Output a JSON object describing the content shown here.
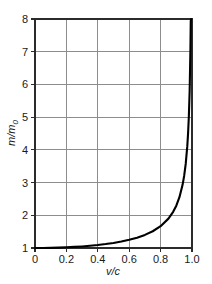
{
  "chart_data": {
    "type": "line",
    "title": "",
    "subtitle": "",
    "xlabel": "v/c",
    "ylabel": "m/m0",
    "ylabel_parts": {
      "main": "m/m",
      "sub": "0"
    },
    "xlim": [
      0,
      1.0
    ],
    "ylim": [
      1,
      8
    ],
    "xticks": [
      0,
      0.2,
      0.4,
      0.6,
      0.8,
      1.0
    ],
    "xtick_labels": [
      "0",
      "0.2",
      "0.4",
      "0.6",
      "0.8",
      "1.0"
    ],
    "yticks": [
      1,
      2,
      3,
      4,
      5,
      6,
      7,
      8
    ],
    "ytick_labels": [
      "1",
      "2",
      "3",
      "4",
      "5",
      "6",
      "7",
      "8"
    ],
    "grid": true,
    "grid_color": "#8d8d8d",
    "frame_color": "#2b2b2b",
    "legend": null,
    "legend_position": "none",
    "annotations": [],
    "series": [
      {
        "name": "relativistic mass ratio",
        "formula": "m/m0 = 1/sqrt(1-(v/c)^2)",
        "color": "#000000",
        "x": [
          0,
          0.05,
          0.1,
          0.15,
          0.2,
          0.25,
          0.3,
          0.35,
          0.4,
          0.45,
          0.5,
          0.55,
          0.6,
          0.65,
          0.7,
          0.75,
          0.8,
          0.85,
          0.88,
          0.9,
          0.92,
          0.94,
          0.95,
          0.96,
          0.97,
          0.975,
          0.98,
          0.985,
          0.99,
          0.992
        ],
        "values": [
          1.0,
          1.001,
          1.005,
          1.011,
          1.021,
          1.033,
          1.048,
          1.068,
          1.091,
          1.12,
          1.155,
          1.197,
          1.25,
          1.316,
          1.4,
          1.512,
          1.667,
          1.898,
          2.105,
          2.294,
          2.552,
          2.931,
          3.203,
          3.571,
          4.113,
          4.5,
          5.025,
          5.799,
          7.089,
          7.93
        ]
      }
    ]
  },
  "axis": {
    "x_title": "v/c",
    "y_title_main": "m/m",
    "y_title_sub": "0"
  }
}
